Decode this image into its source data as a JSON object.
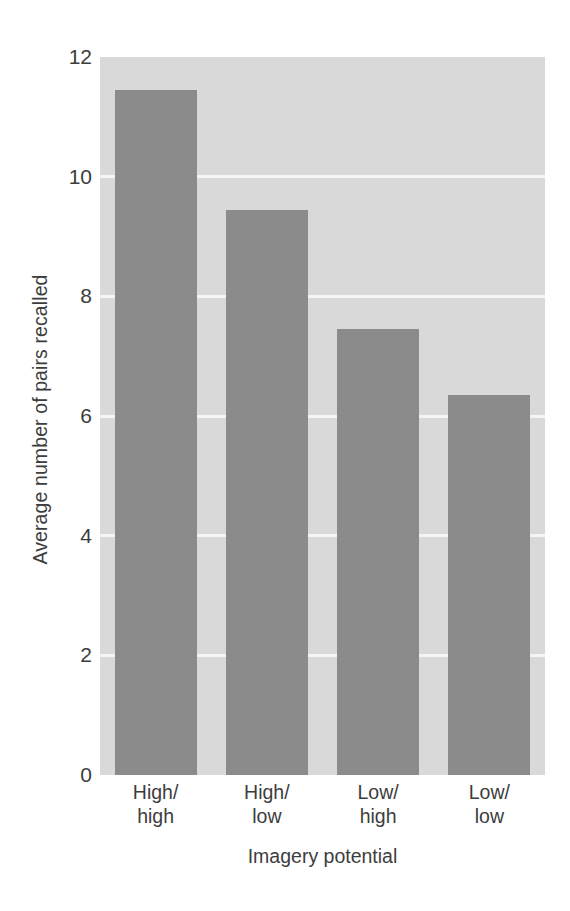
{
  "chart_data": {
    "type": "bar",
    "title": "",
    "subtitle": "",
    "xlabel": "Imagery potential",
    "ylabel": "Average number of pairs recalled",
    "categories": [
      "High/high",
      "High/low",
      "Low/high",
      "Low/low"
    ],
    "category_lines": [
      [
        "High/",
        "high"
      ],
      [
        "High/",
        "low"
      ],
      [
        "Low/",
        "high"
      ],
      [
        "Low/",
        "low"
      ]
    ],
    "values": [
      11.45,
      9.45,
      7.45,
      6.35
    ],
    "ylim": [
      0,
      12
    ],
    "ytick_labels": [
      "0",
      "2",
      "4",
      "6",
      "8",
      "10",
      "12"
    ],
    "ytick_values": [
      0,
      2,
      4,
      6,
      8,
      10,
      12
    ],
    "gridlines": [
      2,
      4,
      6,
      8,
      10
    ],
    "grid": true,
    "legend": "none",
    "colors": {
      "bar": "#8b8b8b",
      "plot_background": "#d9d9d9",
      "gridline": "#f4f4f4",
      "page_background": "#ffffff",
      "text": "#3d3d3d"
    }
  }
}
